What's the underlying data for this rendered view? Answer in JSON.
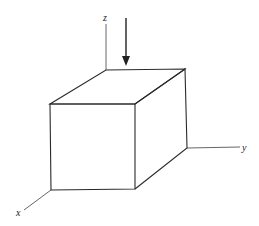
{
  "diagram": {
    "type": "3d-cube-with-axes",
    "axes": {
      "x_label": "x",
      "y_label": "y",
      "z_label": "z"
    },
    "load_arrow": "downward-force-arrow",
    "colors": {
      "stroke": "#2a2a2a",
      "axis": "#555555",
      "background": "#ffffff"
    }
  }
}
